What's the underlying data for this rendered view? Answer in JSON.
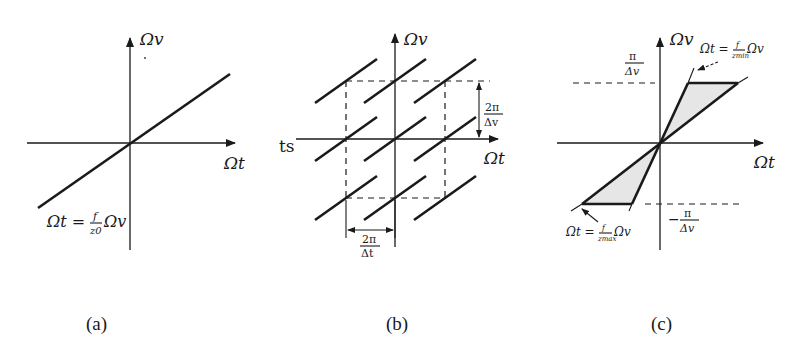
{
  "figure": {
    "panels": [
      {
        "id": "a",
        "caption": "(a)",
        "axis_x_label": "Ωt",
        "axis_y_label": "Ωv",
        "equation": {
          "lhs": "Ωt =",
          "frac_num": "f",
          "frac_den": "z0",
          "rhs": "Ωv"
        }
      },
      {
        "id": "b",
        "caption": "(b)",
        "axis_x_label": "Ωt",
        "axis_y_label": "Ωv",
        "left_label": "ts",
        "period_v": {
          "num": "2π",
          "den": "Δv"
        },
        "period_t": {
          "num": "2π",
          "den": "Δt"
        }
      },
      {
        "id": "c",
        "caption": "(c)",
        "axis_x_label": "Ωt",
        "axis_y_label": "Ωv",
        "upper_bound": {
          "num": "π",
          "den": "Δv"
        },
        "lower_bound": {
          "sign": "−",
          "num": "π",
          "den": "Δv"
        },
        "eq_min": {
          "lhs": "Ωt =",
          "frac_num": "f",
          "frac_den": "zmin",
          "rhs": "Ωv"
        },
        "eq_max": {
          "lhs": "Ωt =",
          "frac_num": "f",
          "frac_den": "zmax",
          "rhs": "Ωv"
        },
        "shade_color": "#e6e6e6"
      }
    ]
  }
}
